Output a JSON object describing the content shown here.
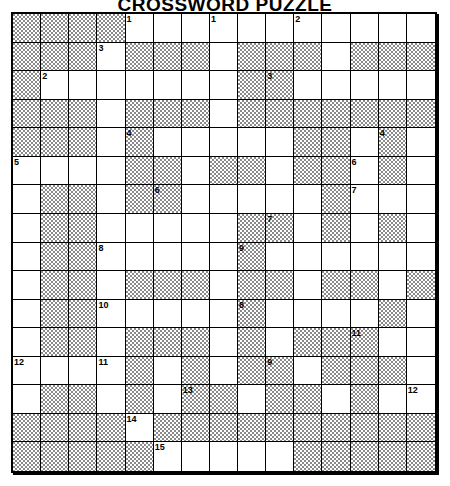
{
  "puzzle": {
    "title": "CROSSWORD PUZZLE",
    "columns": 15,
    "rows": 16,
    "legend": {
      "shaded": "#",
      "white": "."
    },
    "colors": {
      "shaded_fill": "#c9c9c9",
      "shaded_hatch": "#8a8a8a",
      "white_fill": "#ffffff",
      "grid_line": "#000000",
      "text": "#000000"
    },
    "grid": [
      "####...........",
      "###.###.###.###",
      "#.......##.....",
      "###.###.#######",
      "###.#.....##.#.",
      "....##.##.##.#.",
      ".##.##.....#...",
      ".##.....##.#.#.",
      ".##.....#......",
      ".##.###.##.##.#",
      ".##.....#....#.",
      ".##.###.#.###..",
      "....#.#.##.###.",
      ".##.#.##.##.#..",
      "####.##########",
      "#####.....#####"
    ],
    "numbers": [
      {
        "row": 0,
        "col": 4,
        "label": "1"
      },
      {
        "row": 0,
        "col": 7,
        "label": "1"
      },
      {
        "row": 0,
        "col": 10,
        "label": "2"
      },
      {
        "row": 1,
        "col": 3,
        "label": "3"
      },
      {
        "row": 2,
        "col": 1,
        "label": "2"
      },
      {
        "row": 2,
        "col": 9,
        "label": "3"
      },
      {
        "row": 4,
        "col": 4,
        "label": "4"
      },
      {
        "row": 4,
        "col": 13,
        "label": "4"
      },
      {
        "row": 5,
        "col": 0,
        "label": "5"
      },
      {
        "row": 5,
        "col": 12,
        "label": "6"
      },
      {
        "row": 6,
        "col": 5,
        "label": "6"
      },
      {
        "row": 6,
        "col": 12,
        "label": "7"
      },
      {
        "row": 7,
        "col": 9,
        "label": "7"
      },
      {
        "row": 8,
        "col": 3,
        "label": "8"
      },
      {
        "row": 8,
        "col": 8,
        "label": "9"
      },
      {
        "row": 10,
        "col": 3,
        "label": "10"
      },
      {
        "row": 10,
        "col": 8,
        "label": "8"
      },
      {
        "row": 11,
        "col": 12,
        "label": "11"
      },
      {
        "row": 12,
        "col": 3,
        "label": "11"
      },
      {
        "row": 12,
        "col": 9,
        "label": "9"
      },
      {
        "row": 12,
        "col": 0,
        "label": "12"
      },
      {
        "row": 13,
        "col": 6,
        "label": "13"
      },
      {
        "row": 13,
        "col": 14,
        "label": "12"
      },
      {
        "row": 14,
        "col": 4,
        "label": "14"
      },
      {
        "row": 15,
        "col": 5,
        "label": "15"
      }
    ]
  }
}
